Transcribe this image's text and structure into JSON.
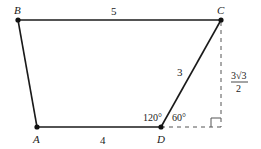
{
  "diagram": {
    "type": "trapezoid",
    "vertices": {
      "A": {
        "label": "A",
        "x": 37,
        "y": 127
      },
      "B": {
        "label": "B",
        "x": 18,
        "y": 20
      },
      "C": {
        "label": "C",
        "x": 221,
        "y": 20
      },
      "D": {
        "label": "D",
        "x": 161,
        "y": 127
      }
    },
    "edges": {
      "BC": {
        "label": "5"
      },
      "CD": {
        "label": "3"
      },
      "AD": {
        "label": "4"
      }
    },
    "angles": {
      "ADC": {
        "label": "120°"
      },
      "CD_ext": {
        "label": "60°"
      }
    },
    "height": {
      "label_numerator": "3√3",
      "label_denominator": "2"
    },
    "colors": {
      "line": "#1a1a1a",
      "dashed": "#555555"
    }
  }
}
